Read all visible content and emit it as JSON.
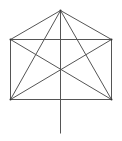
{
  "diagram": {
    "stroke_color": "#555555",
    "points": {
      "apex": [
        60,
        10
      ],
      "top_left": [
        10,
        39
      ],
      "top_right": [
        111,
        39
      ],
      "bottom_left": [
        10,
        99
      ],
      "bottom_right": [
        111,
        99
      ],
      "stem_end": [
        60,
        133
      ]
    },
    "segments": [
      [
        "apex",
        "top_left"
      ],
      [
        "apex",
        "top_right"
      ],
      [
        "top_left",
        "top_right"
      ],
      [
        "top_left",
        "bottom_left"
      ],
      [
        "top_right",
        "bottom_right"
      ],
      [
        "bottom_left",
        "bottom_right"
      ],
      [
        "top_left",
        "bottom_right"
      ],
      [
        "top_right",
        "bottom_left"
      ],
      [
        "apex",
        "bottom_left"
      ],
      [
        "apex",
        "bottom_right"
      ],
      [
        "apex",
        "stem_end"
      ]
    ]
  }
}
